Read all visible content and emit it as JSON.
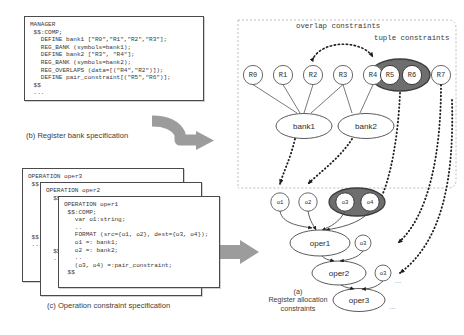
{
  "figure": {
    "caption_a_tag": "(a)",
    "caption_a_text": "Register allocation constraints",
    "caption_b": "(b) Register bank specification",
    "caption_c": "(c) Operation constraint specification"
  },
  "labels": {
    "overlap": "overlap constraints",
    "tuple": "tuple constraints",
    "ellipsis": "..."
  },
  "code": {
    "manager_title": "MANAGER",
    "manager_body": "MANAGER\n $$:COMP;\n   DEFINE bank1 [\"R0\",\"R1\",\"R2\",\"R3\"];\n   REG_BANK (symbols=bank1);\n   DEFINE bank2 [\"R3\", \"R4\"];\n   REG_BANK (symbols=bank2);\n   REG_OVERLAPS (data=[(\"R4\",\"R2\")]);\n   DEFINE pair_constraint[(\"R5\",\"R6\")];\n $$\n ...",
    "oper3_body": "OPERATION oper3\n $$\n\n\n\n\n\n\n $$\n ...",
    "oper2_body": "OPERATION oper2\n  $$\n\n\n\n\n\n\n  $$\n  ...",
    "oper1_body": "OPERATION oper1\n $$:COMP;\n   var o1:string;\n   ..\n   FORMAT (src={o1, o2}, dest={o3, o4});\n   o1 =: bank1;\n   o2 =: bank2;\n   ..\n   (o3, o4) =:pair_constraint;\n $$"
  },
  "graph": {
    "registers": [
      "R0",
      "R1",
      "R2",
      "R3",
      "R4",
      "R5",
      "R6",
      "R7"
    ],
    "banks": [
      "bank1",
      "bank2"
    ],
    "operands": [
      "o1",
      "o2",
      "o3",
      "o4"
    ],
    "operations": [
      "oper1",
      "oper2",
      "oper3"
    ],
    "tuple_operand_labels": [
      "o3",
      "o3"
    ]
  },
  "colors": {
    "tuple_fill": "#6e6e6e",
    "arrow_gray": "#9c9c9c",
    "dashed_border": "#b9b9b9",
    "node_stroke": "#6a6a6a"
  }
}
